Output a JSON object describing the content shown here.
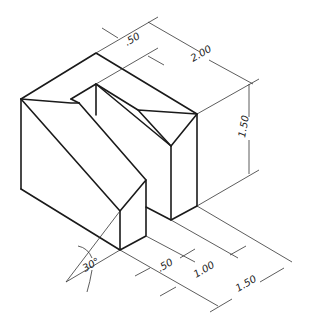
{
  "figure": {
    "type": "isometric technical drawing",
    "colors": {
      "line": "#1a1a1a",
      "dimension": "#333333",
      "background": "#ffffff"
    }
  },
  "dimensions": {
    "slot_width_top": ".50",
    "depth": "2.00",
    "height": "1.50",
    "front_offset_1": ".50",
    "front_offset_2": "1.00",
    "width": "1.50",
    "angle": "30°"
  }
}
